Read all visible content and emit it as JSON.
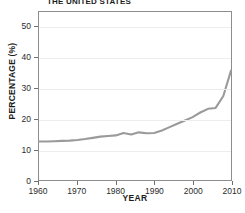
{
  "chart_data": {
    "type": "line",
    "title": "THE UNITED STATES",
    "xlabel": "YEAR",
    "ylabel": "PERCENTAGE (%)",
    "xlim": [
      1960,
      2010
    ],
    "ylim": [
      0,
      55
    ],
    "grid": true,
    "legend": "none",
    "line_color": "#9a9a9a",
    "xticks": [
      1960,
      1970,
      1980,
      1990,
      2000,
      2010
    ],
    "yticks": [
      0,
      10,
      20,
      30,
      40,
      50
    ],
    "x": [
      1960,
      1962,
      1964,
      1966,
      1968,
      1970,
      1972,
      1974,
      1976,
      1978,
      1980,
      1982,
      1984,
      1986,
      1988,
      1990,
      1992,
      1994,
      1996,
      1998,
      2000,
      2002,
      2004,
      2006,
      2008,
      2010
    ],
    "values": [
      12.6,
      12.6,
      12.7,
      12.8,
      12.9,
      13.1,
      13.4,
      13.8,
      14.2,
      14.4,
      14.6,
      15.4,
      14.9,
      15.6,
      15.3,
      15.4,
      16.2,
      17.3,
      18.4,
      19.5,
      20.6,
      22.1,
      23.3,
      23.6,
      27.5,
      35.8
    ],
    "series": [
      {
        "name": "Percentage",
        "values": [
          12.6,
          12.6,
          12.7,
          12.8,
          12.9,
          13.1,
          13.4,
          13.8,
          14.2,
          14.4,
          14.6,
          15.4,
          14.9,
          15.6,
          15.3,
          15.4,
          16.2,
          17.3,
          18.4,
          19.5,
          20.6,
          22.1,
          23.3,
          23.6,
          27.5,
          35.8
        ]
      }
    ]
  }
}
